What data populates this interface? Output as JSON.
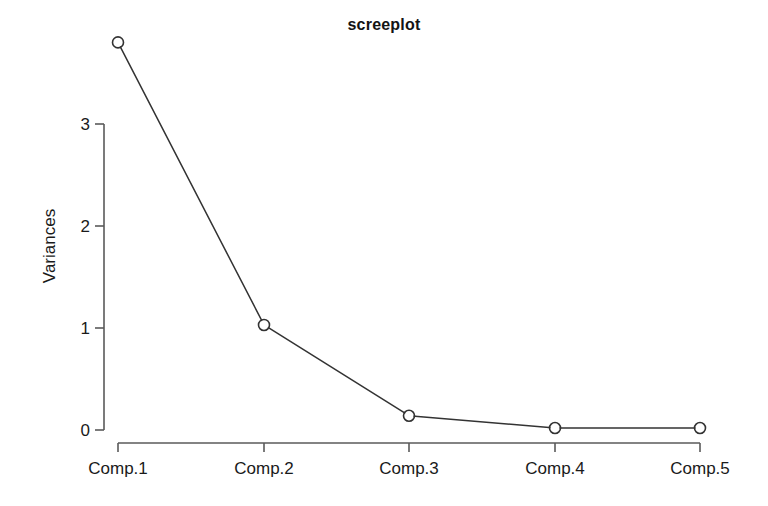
{
  "chart_data": {
    "type": "line",
    "title": "screeplot",
    "xlabel": "",
    "ylabel": "Variances",
    "categories": [
      "Comp.1",
      "Comp.2",
      "Comp.3",
      "Comp.4",
      "Comp.5"
    ],
    "values": [
      3.8,
      1.03,
      0.14,
      0.02,
      0.02
    ],
    "series": [
      {
        "name": "Variances",
        "values": [
          3.8,
          1.03,
          0.14,
          0.02,
          0.02
        ]
      }
    ],
    "ylim": [
      0,
      3.9
    ],
    "yticks": [
      "0",
      "1",
      "2",
      "3"
    ],
    "ytick_values": [
      0,
      1,
      2,
      3
    ],
    "grid": false,
    "legend": "none",
    "marker": "open-circle",
    "line_color": "#333333",
    "axis_color": "#5a5a5a",
    "background": "#ffffff"
  },
  "axes": {
    "y_label": "Variances",
    "y_tick_labels": [
      "3",
      "2",
      "1",
      "0"
    ],
    "x_tick_labels": [
      "Comp.1",
      "Comp.2",
      "Comp.3",
      "Comp.4",
      "Comp.5"
    ]
  }
}
